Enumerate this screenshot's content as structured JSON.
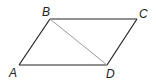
{
  "diagram": {
    "type": "parallelogram",
    "vertices": [
      {
        "label": "A",
        "x": 19,
        "y": 65,
        "lx": 9,
        "ly": 77
      },
      {
        "label": "B",
        "x": 50,
        "y": 19,
        "lx": 42,
        "ly": 16
      },
      {
        "label": "C",
        "x": 137,
        "y": 19,
        "lx": 139,
        "ly": 18
      },
      {
        "label": "D",
        "x": 107,
        "y": 65,
        "lx": 106,
        "ly": 78
      }
    ],
    "edges": [
      [
        "A",
        "B"
      ],
      [
        "B",
        "C"
      ],
      [
        "C",
        "D"
      ],
      [
        "D",
        "A"
      ]
    ],
    "diagonals": [
      [
        "B",
        "D"
      ]
    ],
    "colors": {
      "edge": "#222222",
      "diagonal": "#9a9a9a"
    }
  }
}
